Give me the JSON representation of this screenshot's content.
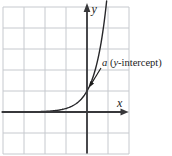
{
  "figure": {
    "name": "exponential-function-graph-with-y-intercept",
    "canvas": {
      "width": 172,
      "height": 156,
      "background": "#ffffff"
    },
    "grid": {
      "color": "#c6c9ce",
      "stroke_width": 1,
      "vertical_x": [
        3,
        24,
        45,
        66,
        87,
        108,
        129
      ],
      "horizontal_y": [
        7,
        28,
        49,
        70,
        91,
        112,
        133,
        154
      ]
    },
    "axes": {
      "color": "#37373a",
      "stroke_width": 1.8,
      "x_axis": {
        "y": 112,
        "x_start": 2,
        "x_end": 121.5,
        "arrow_tip_x": 128.5,
        "arrow_len": 8,
        "arrow_half_w": 3.4
      },
      "y_axis": {
        "x": 87,
        "y_bottom": 153.5,
        "y_top": 10,
        "arrow_tip_y": 3,
        "arrow_len": 9,
        "arrow_half_w": 3.4
      }
    },
    "axis_labels": {
      "x": {
        "text": "x",
        "x": 117,
        "baseline_y": 107
      },
      "y": {
        "text": "y",
        "x": 91.5,
        "baseline_y": 13
      }
    },
    "curve": {
      "color": "#27272a",
      "stroke_width": 1.4,
      "type": "exponential",
      "origin_px": [
        87,
        112
      ],
      "cell_px": 21,
      "growth_k": 1.78,
      "x_min_px": 2,
      "y_min_px": 1
    },
    "annotation": {
      "color": "#1b1b1b",
      "text_x": 102,
      "text_baseline_y": 66,
      "parts": [
        {
          "text": "a"
        },
        {
          "text": " ("
        },
        {
          "text": "y"
        },
        {
          "text": "-intercept)"
        }
      ],
      "arrow": {
        "from": [
          101,
          68
        ],
        "to": [
          89,
          87.5
        ],
        "stroke_width": 1.1,
        "head_len": 6,
        "head_half_w": 2.3
      }
    }
  }
}
